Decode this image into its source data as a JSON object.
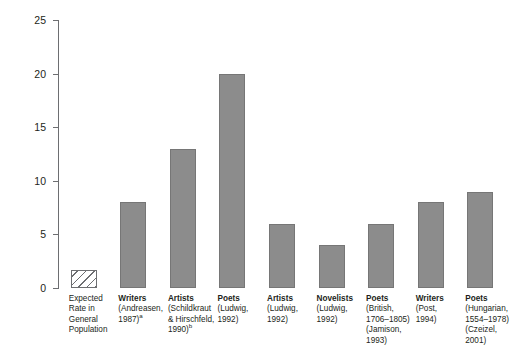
{
  "chart_data": {
    "type": "bar",
    "title": "",
    "xlabel": "",
    "ylabel": "Percentage",
    "ylim": [
      0,
      25
    ],
    "yticks": [
      0,
      5,
      10,
      15,
      20,
      25
    ],
    "ytick_labels": [
      "0",
      "5",
      "10",
      "15",
      "20",
      "25"
    ],
    "grid": false,
    "legend": "none",
    "bar_color": "#8c8c8c",
    "bar_edge_color": "#767676",
    "hatch_color": "#6d6e71",
    "axis_color": "#6d6e71",
    "categories": [
      "Expected Rate in General Population",
      "Writers (Andreasen, 1987)a",
      "Artists (Schildkraut & Hirschfeld, 1990)b",
      "Poets (Ludwig, 1992)",
      "Artists (Ludwig, 1992)",
      "Novelists (Ludwig, 1992)",
      "Poets (British, 1706-1805) (Jamison, 1993)",
      "Writers (Post, 1994)",
      "Poets (Hungarian, 1554-1978) (Czeizel, 2001)"
    ],
    "values": [
      1.7,
      8,
      13,
      20,
      6,
      4,
      6,
      8,
      9
    ],
    "bars": [
      {
        "value": 1.7,
        "style": "hatched",
        "heading": "",
        "lines": [
          "Expected",
          "Rate in",
          "General",
          "Population"
        ],
        "sup": ""
      },
      {
        "value": 8,
        "style": "solid",
        "heading": "Writers",
        "lines": [
          "(Andreasen,",
          "1987)"
        ],
        "sup": "a"
      },
      {
        "value": 13,
        "style": "solid",
        "heading": "Artists",
        "lines": [
          "(Schildkraut",
          "& Hirschfeld,",
          "1990)"
        ],
        "sup": "b"
      },
      {
        "value": 20,
        "style": "solid",
        "heading": "Poets",
        "lines": [
          "(Ludwig,",
          "1992)"
        ],
        "sup": ""
      },
      {
        "value": 6,
        "style": "solid",
        "heading": "Artists",
        "lines": [
          "(Ludwig,",
          "1992)"
        ],
        "sup": ""
      },
      {
        "value": 4,
        "style": "solid",
        "heading": "Novelists",
        "lines": [
          "(Ludwig,",
          "1992)"
        ],
        "sup": ""
      },
      {
        "value": 6,
        "style": "solid",
        "heading": "Poets",
        "lines": [
          "(British,",
          "1706–1805)",
          "(Jamison,",
          "1993)"
        ],
        "sup": ""
      },
      {
        "value": 8,
        "style": "solid",
        "heading": "Writers",
        "lines": [
          "(Post,",
          "1994)"
        ],
        "sup": ""
      },
      {
        "value": 9,
        "style": "solid",
        "heading": "Poets",
        "lines": [
          "(Hungarian,",
          "1554–1978)",
          "(Czeizel,",
          "2001)"
        ],
        "sup": ""
      }
    ]
  }
}
